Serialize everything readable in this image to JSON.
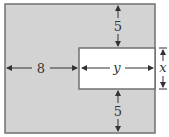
{
  "diagram": {
    "colors": {
      "shaded": "#d3d3d3",
      "border": "#707070",
      "inner": "#ffffff",
      "arrow": "#333333"
    },
    "labels": {
      "top_gap": "5",
      "left_width": "8",
      "inner_width": "y",
      "inner_height": "x",
      "bottom_gap": "5"
    }
  }
}
